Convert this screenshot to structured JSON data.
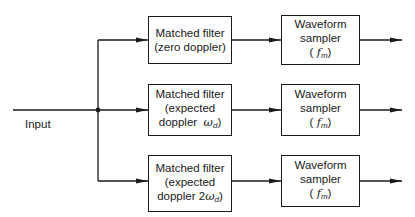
{
  "input_label": "Input",
  "rows": [
    {
      "filter": {
        "line1": "Matched filter",
        "line2": "(zero doppler)",
        "line3": ""
      },
      "sampler": {
        "line1": "Waveform",
        "line2": "sampler",
        "line3": "(f_m)"
      }
    },
    {
      "filter": {
        "line1": "Matched filter",
        "line2": "(expected",
        "line3": "doppler ω_d)"
      },
      "sampler": {
        "line1": "Waveform",
        "line2": "sampler",
        "line3": "(f_m)"
      }
    },
    {
      "filter": {
        "line1": "Matched filter",
        "line2": "(expected",
        "line3": "doppler 2ω_d)"
      },
      "sampler": {
        "line1": "Waveform",
        "line2": "sampler",
        "line3": "(f_m)"
      }
    }
  ],
  "sym": {
    "f": "f",
    "m": "m",
    "omega": "ω",
    "d": "d",
    "paren_open": "(",
    "paren_close": ")",
    "doppler": "doppler",
    "two": "2"
  },
  "colors": {
    "line": "#1a1a1a",
    "background": "#ffffff"
  }
}
